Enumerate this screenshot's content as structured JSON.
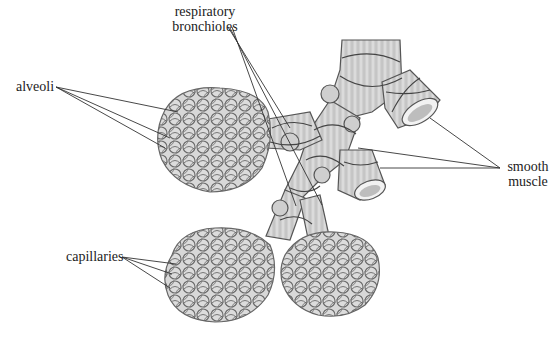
{
  "figure": {
    "labels": {
      "respiratory_bronchioles_line1": "respiratory",
      "respiratory_bronchioles_line2": "bronchioles",
      "alveoli": "alveoli",
      "smooth_muscle_line1": "smooth",
      "smooth_muscle_line2": "muscle",
      "capillaries": "capillaries"
    },
    "colors": {
      "background": "#ffffff",
      "tissue_fill": "#d6d6d6",
      "tissue_stroke": "#555555",
      "leader_line": "#333333",
      "text": "#222222"
    }
  }
}
